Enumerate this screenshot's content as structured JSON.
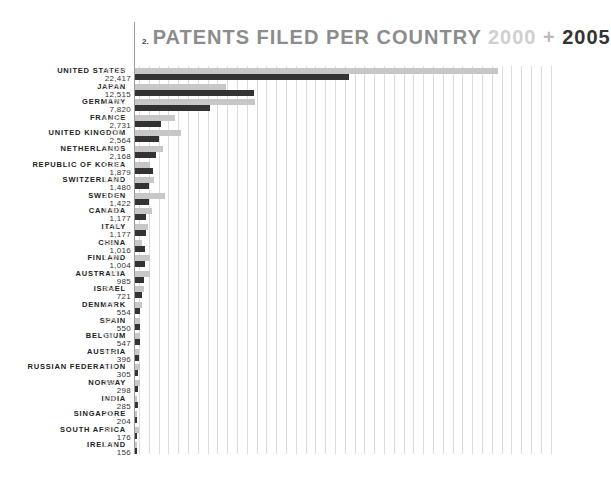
{
  "title": {
    "number": "2.",
    "main": "PATENTS FILED PER COUNTRY ",
    "year_a": "2000",
    "plus": " + ",
    "year_b": "2005"
  },
  "colors": {
    "bar_2000": "#c7c7c7",
    "bar_2005": "#333333",
    "title_main": "#8c8c8c",
    "gridline": "#dcdcdc"
  },
  "chart_data": {
    "type": "bar",
    "orientation": "horizontal",
    "xlabel": "",
    "ylabel": "",
    "grid": true,
    "legend": "encoded in title (light grey = 2000, dark = 2005)",
    "categories": [
      "UNITED STATES",
      "JAPAN",
      "GERMANY",
      "FRANCE",
      "UNITED KINGDOM",
      "NETHERLANDS",
      "REPUBLIC OF KOREA",
      "SWITZERLAND",
      "SWEDEN",
      "CANADA",
      "ITALY",
      "CHINA",
      "FINLAND",
      "AUSTRALIA",
      "ISRAEL",
      "DENMARK",
      "SPAIN",
      "BELGIUM",
      "AUSTRIA",
      "RUSSIAN FEDERATION",
      "NORWAY",
      "INDIA",
      "SINGAPORE",
      "SOUTH AFRICA",
      "IRELAND"
    ],
    "series": [
      {
        "name": "2000",
        "values": [
          38007,
          9567,
          12582,
          4183,
          4795,
          2928,
          1580,
          1989,
          3091,
          1801,
          1394,
          784,
          1557,
          1567,
          964,
          735,
          555,
          561,
          464,
          523,
          548,
          190,
          232,
          387,
          235
        ]
      },
      {
        "name": "2005",
        "values": [
          22417,
          12515,
          7820,
          2731,
          2564,
          2168,
          1879,
          1480,
          1422,
          1177,
          1177,
          1016,
          1004,
          985,
          721,
          554,
          550,
          547,
          396,
          305,
          298,
          285,
          204,
          176,
          156
        ]
      }
    ],
    "xlim": [
      0,
      44000
    ]
  },
  "rows": [
    {
      "country": "UNITED STATES",
      "v2000": "38,007",
      "v2005": "22,417"
    },
    {
      "country": "JAPAN",
      "v2000": "9,567",
      "v2005": "12,515"
    },
    {
      "country": "GERMANY",
      "v2000": "12,582",
      "v2005": "7,820"
    },
    {
      "country": "FRANCE",
      "v2000": "4,183",
      "v2005": "2,731"
    },
    {
      "country": "UNITED KINGDOM",
      "v2000": "4,795",
      "v2005": "2,564"
    },
    {
      "country": "NETHERLANDS",
      "v2000": "2,928",
      "v2005": "2,168"
    },
    {
      "country": "REPUBLIC OF KOREA",
      "v2000": "1,580",
      "v2005": "1,879"
    },
    {
      "country": "SWITZERLAND",
      "v2000": "1,989",
      "v2005": "1,480"
    },
    {
      "country": "SWEDEN",
      "v2000": "3,091",
      "v2005": "1,422"
    },
    {
      "country": "CANADA",
      "v2000": "1,801",
      "v2005": "1,177"
    },
    {
      "country": "ITALY",
      "v2000": "1,394",
      "v2005": "1,177"
    },
    {
      "country": "CHINA",
      "v2000": "784",
      "v2005": "1,016"
    },
    {
      "country": "FINLAND",
      "v2000": "1,557",
      "v2005": "1,004"
    },
    {
      "country": "AUSTRALIA",
      "v2000": "1,567",
      "v2005": "985"
    },
    {
      "country": "ISRAEL",
      "v2000": "964",
      "v2005": "721"
    },
    {
      "country": "DENMARK",
      "v2000": "735",
      "v2005": "554"
    },
    {
      "country": "SPAIN",
      "v2000": "555",
      "v2005": "550"
    },
    {
      "country": "BELGIUM",
      "v2000": "561",
      "v2005": "547"
    },
    {
      "country": "AUSTRIA",
      "v2000": "464",
      "v2005": "396"
    },
    {
      "country": "RUSSIAN FEDERATION",
      "v2000": "523",
      "v2005": "305"
    },
    {
      "country": "NORWAY",
      "v2000": "548",
      "v2005": "298"
    },
    {
      "country": "INDIA",
      "v2000": "190",
      "v2005": "285"
    },
    {
      "country": "SINGAPORE",
      "v2000": "232",
      "v2005": "204"
    },
    {
      "country": "SOUTH AFRICA",
      "v2000": "387",
      "v2005": "176"
    },
    {
      "country": "IRELAND",
      "v2000": "235",
      "v2005": "156"
    }
  ]
}
